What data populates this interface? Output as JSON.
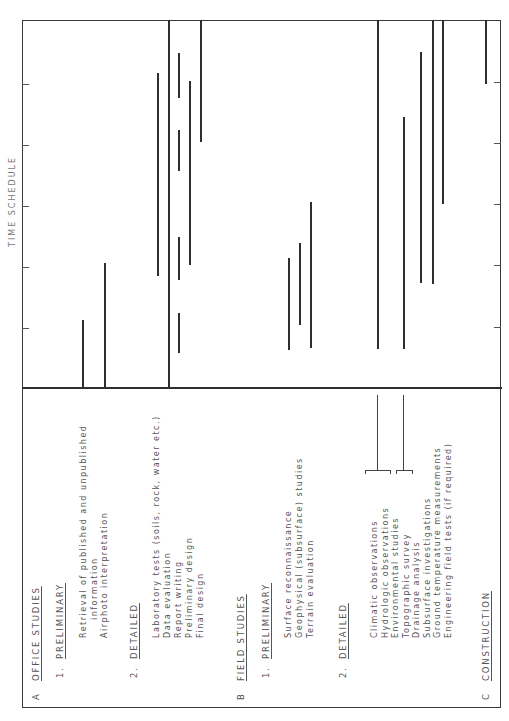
{
  "title": "TIME SCHEDULE",
  "sections": [
    {
      "letter": "A",
      "label": "OFFICE STUDIES",
      "groups": [
        {
          "number": "1.",
          "label": "PRELIMINARY",
          "items": [
            "Retrieval of published and unpublished",
            "information",
            "Airphoto interpretation"
          ]
        },
        {
          "number": "2.",
          "label": "DETAILED",
          "items": [
            "Laboratory tests (soils, rock, water etc.)",
            "Data evaluation",
            "Report writing",
            "Preliminary design",
            "Final design"
          ]
        }
      ]
    },
    {
      "letter": "B",
      "label": "FIELD STUDIES",
      "groups": [
        {
          "number": "1.",
          "label": "PRELIMINARY",
          "items": [
            "Surface reconnaissance",
            "Geophysical (subsurface) studies",
            "Terrain evaluation"
          ]
        },
        {
          "number": "2.",
          "label": "DETAILED",
          "items": [
            "Climatic observations",
            "Hydrologic observations",
            "Environmental studies",
            "Topographic survey",
            "Drainage analysis",
            "Subsurface investigations",
            "Ground temperature measurements",
            "Engineering field tests (if required)"
          ]
        }
      ]
    },
    {
      "letter": "C",
      "label": "CONSTRUCTION",
      "groups": []
    }
  ],
  "schedule_bars": [
    {
      "task": "Retrieval of published and unpublished information",
      "x": 83,
      "y1": 320,
      "y2": 388
    },
    {
      "task": "Airphoto interpretation",
      "x": 105,
      "y1": 263,
      "y2": 388
    },
    {
      "task": "Laboratory tests",
      "x": 158,
      "y1": 73,
      "y2": 276
    },
    {
      "task": "Data evaluation",
      "x": 169,
      "y1": 20,
      "y2": 388
    },
    {
      "task": "Report writing",
      "x": 179,
      "segments": [
        [
          53,
          98
        ],
        [
          130,
          171
        ],
        [
          237,
          280
        ],
        [
          313,
          353
        ]
      ]
    },
    {
      "task": "Preliminary design",
      "x": 190,
      "y1": 81,
      "y2": 265
    },
    {
      "task": "Final design",
      "x": 201,
      "y1": 20,
      "y2": 142
    },
    {
      "task": "Surface reconnaissance",
      "x": 289,
      "y1": 258,
      "y2": 350
    },
    {
      "task": "Geophysical (subsurface) studies",
      "x": 300,
      "y1": 243,
      "y2": 325
    },
    {
      "task": "Terrain evaluation",
      "x": 311,
      "y1": 202,
      "y2": 348
    },
    {
      "task": "Climatic / Hydrologic / Environmental",
      "x": 378,
      "y1": 20,
      "y2": 349
    },
    {
      "task": "Topographic survey / Drainage analysis",
      "x": 404,
      "y1": 117,
      "y2": 349
    },
    {
      "task": "Subsurface investigations",
      "x": 421,
      "y1": 52,
      "y2": 283
    },
    {
      "task": "Ground temperature measurements",
      "x": 433,
      "y1": 20,
      "y2": 284
    },
    {
      "task": "Engineering field tests",
      "x": 443,
      "y1": 20,
      "y2": 204
    },
    {
      "task": "Construction",
      "x": 486,
      "y1": 20,
      "y2": 84
    }
  ]
}
